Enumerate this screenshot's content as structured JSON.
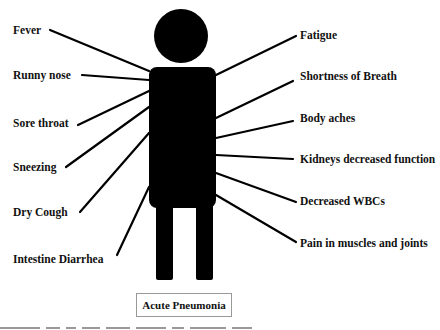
{
  "diagram": {
    "title": "Acute Pneumonia",
    "figure": "human-silhouette",
    "left_symptoms": [
      {
        "label": "Fever"
      },
      {
        "label": "Runny nose"
      },
      {
        "label": "Sore throat"
      },
      {
        "label": "Sneezing"
      },
      {
        "label": "Dry Cough"
      },
      {
        "label": "Intestine Diarrhea"
      }
    ],
    "right_symptoms": [
      {
        "label": "Fatigue"
      },
      {
        "label": "Shortness of Breath"
      },
      {
        "label": "Body aches"
      },
      {
        "label": "Kidneys decreased function"
      },
      {
        "label": "Decreased WBCs"
      },
      {
        "label": "Pain in muscles and joints"
      }
    ]
  }
}
